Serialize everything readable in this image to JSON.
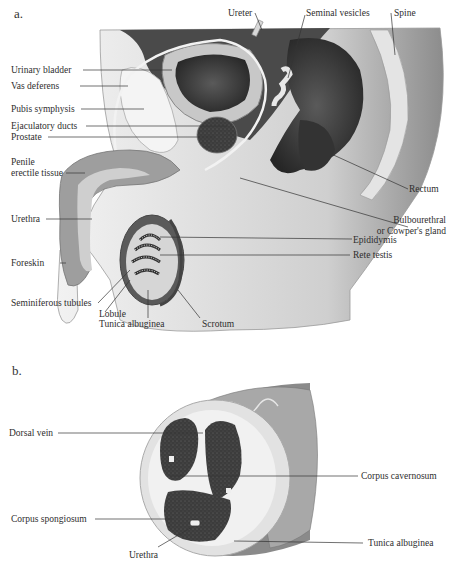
{
  "figure": {
    "panels": [
      {
        "id": "a",
        "label": "a.",
        "labels": {
          "ureter": "Ureter",
          "seminal_vesicles": "Seminal vesicles",
          "spine": "Spine",
          "urinary_bladder": "Urinary bladder",
          "vas_deferens": "Vas deferens",
          "pubis_symphysis": "Pubis symphysis",
          "ejaculatory_ducts": "Ejaculatory ducts",
          "prostate": "Prostate",
          "penile_erectile_tissue_1": "Penile",
          "penile_erectile_tissue_2": "erectile tissue",
          "rectum": "Rectum",
          "urethra": "Urethra",
          "bulbourethral_1": "Bulbourethral",
          "bulbourethral_2": "or Cowper's gland",
          "epididymis": "Epididymis",
          "rete_testis": "Rete testis",
          "foreskin": "Foreskin",
          "seminiferous_tubules": "Seminiferous tubules",
          "lobule": "Lobule",
          "tunica_albuginea": "Tunica albuginea",
          "scrotum": "Scrotum"
        }
      },
      {
        "id": "b",
        "label": "b.",
        "labels": {
          "dorsal_vein": "Dorsal vein",
          "corpus_cavernosum": "Corpus cavernosum",
          "corpus_spongiosum": "Corpus spongiosum",
          "tunica_albuginea": "Tunica albuginea",
          "urethra": "Urethra"
        }
      }
    ],
    "colors": {
      "dark_tissue": "#3a3a3a",
      "mid_tissue": "#8a8a8a",
      "light_tissue": "#d8d8d8",
      "leader_line": "#333333"
    }
  }
}
